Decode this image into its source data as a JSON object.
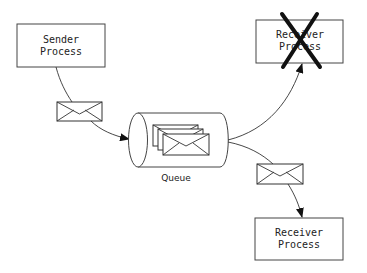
{
  "diagram": {
    "sender": {
      "line1": "Sender",
      "line2": "Process"
    },
    "receiver_top": {
      "line1": "Receiver",
      "line2": "Process",
      "status": "failed (crossed out)"
    },
    "receiver_bottom": {
      "line1": "Receiver",
      "line2": "Process"
    },
    "queue": {
      "label": "Queue",
      "message_count_shown": 3
    },
    "edges": [
      {
        "from": "sender",
        "to": "queue",
        "carries": "message"
      },
      {
        "from": "queue",
        "to": "receiver_top",
        "carries": "none"
      },
      {
        "from": "queue",
        "to": "receiver_bottom",
        "carries": "message"
      }
    ]
  }
}
